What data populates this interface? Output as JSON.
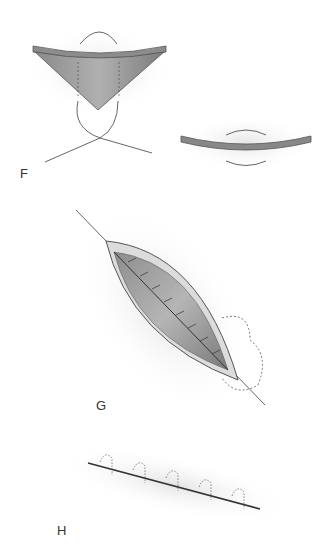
{
  "panels": [
    {
      "label": "F",
      "description": "Inverted cone of tissue with suture passing beneath; flattened disc with rotation arrows"
    },
    {
      "label": "G",
      "description": "Elliptical wound with running suture closure and dotted outline flap"
    },
    {
      "label": "H",
      "description": "Closed linear incision with interrupted subcuticular sutures"
    }
  ]
}
